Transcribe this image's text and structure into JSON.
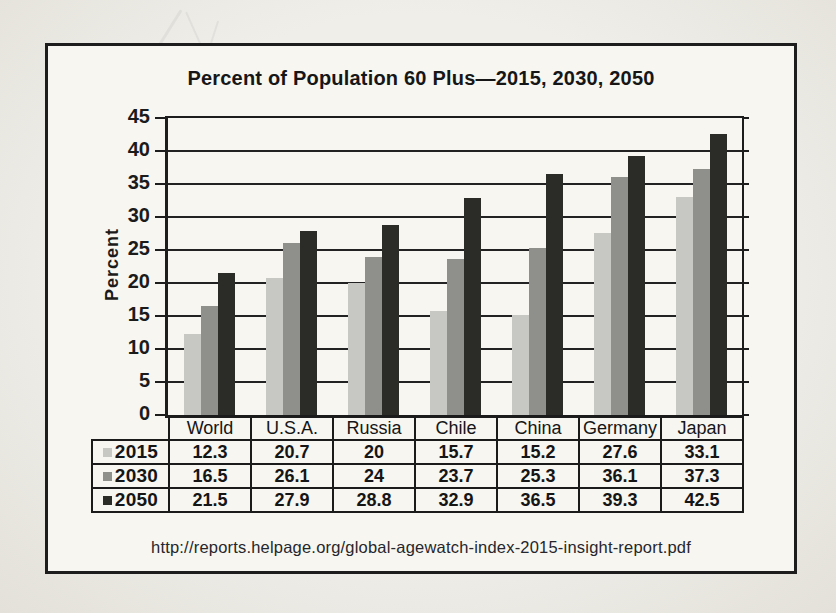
{
  "page": {
    "source_url": "http://reports.helpage.org/global-agewatch-index-2015-insight-report.pdf"
  },
  "chart_data": {
    "type": "bar",
    "title": "Percent of Population 60 Plus—2015, 2030, 2050",
    "xlabel": "",
    "ylabel": "Percent",
    "ylim": [
      0,
      45
    ],
    "ytick_step": 5,
    "yticks": [
      0,
      5,
      10,
      15,
      20,
      25,
      30,
      35,
      40,
      45
    ],
    "grid": true,
    "legend_position": "table-rows-left",
    "categories": [
      "World",
      "U.S.A.",
      "Russia",
      "Chile",
      "China",
      "Germany",
      "Japan"
    ],
    "series": [
      {
        "name": "2015",
        "color": "#c7c7c4",
        "values": [
          12.3,
          20.7,
          20,
          15.7,
          15.2,
          27.6,
          33.1
        ]
      },
      {
        "name": "2030",
        "color": "#8f8f8c",
        "values": [
          16.5,
          26.1,
          24,
          23.7,
          25.3,
          36.1,
          37.3
        ]
      },
      {
        "name": "2050",
        "color": "#2b2b28",
        "values": [
          21.5,
          27.9,
          28.8,
          32.9,
          36.5,
          39.3,
          42.5
        ]
      }
    ],
    "colors": {
      "ink": "#1d1d1d",
      "paper": "#f7f6f1",
      "page_background": "#ebe9e2"
    }
  }
}
